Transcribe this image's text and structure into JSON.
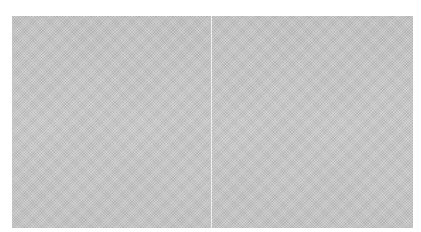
{
  "image": {
    "description": "Two adjacent gray dithered halftone panels on a white background",
    "panels": [
      {
        "name": "left",
        "color": "#c4c4c4"
      },
      {
        "name": "right",
        "color": "#cacaca"
      }
    ],
    "background_color": "#ffffff"
  }
}
